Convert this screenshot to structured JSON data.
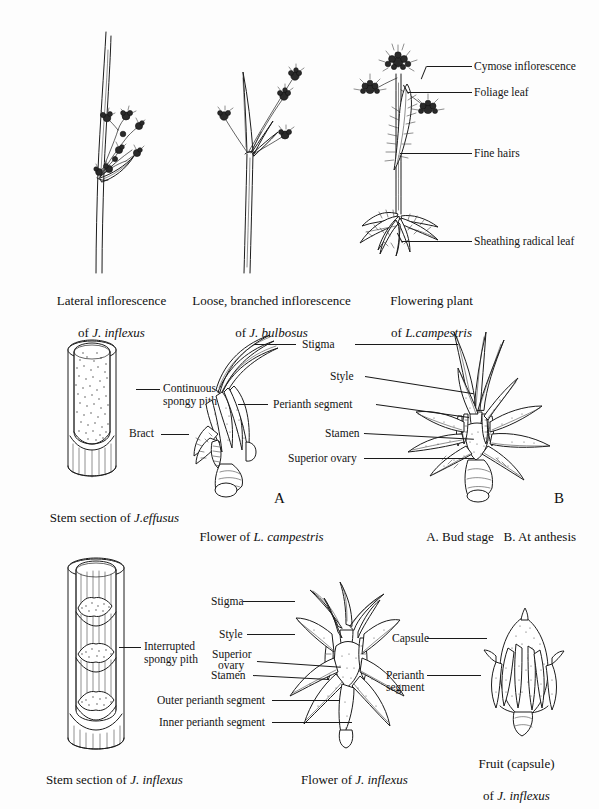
{
  "plate": {
    "title": "Juncaceae plant structure plate",
    "background_color": "#fdfdfd",
    "ink_color": "#1c1c1c"
  },
  "figures": [
    {
      "id": "lateral-inflorescence",
      "caption_line1": "Lateral inflorescence",
      "caption_line2_prefix": "of ",
      "caption_line2_italic": "J. inflexus",
      "labels": []
    },
    {
      "id": "loose-branched-inflorescence",
      "caption_line1": "Loose, branched inflorescence",
      "caption_line2_prefix": "of ",
      "caption_line2_italic": "J. bulbosus",
      "labels": []
    },
    {
      "id": "flowering-plant",
      "caption_line1": "Flowering plant",
      "caption_line2_prefix": "of ",
      "caption_line2_italic": "L.campestris",
      "labels": [
        "Cymose inflorescence",
        "Foliage leaf",
        "Fine hairs",
        "Sheathing radical leaf"
      ]
    },
    {
      "id": "stem-section-effusus",
      "caption_line1_prefix": "Stem section of ",
      "caption_line1_italic": "J.effusus",
      "labels": [
        "Continuous",
        "spongy pith"
      ]
    },
    {
      "id": "flower-l-campestris",
      "caption_line1_prefix": "Flower of ",
      "caption_line1_italic": "L. campestris",
      "labels": [
        "Bract"
      ]
    },
    {
      "id": "flower-stages",
      "caption_line1": "A. Bud stage   B. At anthesis",
      "labels": [
        "Stigma",
        "Style",
        "Perianth segment",
        "Stamen",
        "Superior ovary"
      ],
      "markers": [
        "A",
        "B"
      ]
    },
    {
      "id": "stem-section-inflexus",
      "caption_line1_prefix": "Stem section of ",
      "caption_line1_italic": "J. inflexus",
      "labels": [
        "Interrupted",
        "spongy pith"
      ]
    },
    {
      "id": "flower-j-inflexus",
      "caption_line1_prefix": "Flower of ",
      "caption_line1_italic": "J. inflexus",
      "labels": [
        "Stigma",
        "Style",
        "Superior",
        "ovary",
        "Stamen",
        "Outer perianth segment",
        "Inner perianth segment"
      ]
    },
    {
      "id": "fruit-capsule",
      "caption_line1": "Fruit (capsule)",
      "caption_line2_prefix": "of ",
      "caption_line2_italic": "J. inflexus",
      "labels": [
        "Capsule",
        "Perianth",
        "segment"
      ]
    }
  ],
  "text": {
    "cymose_inflorescence": "Cymose inflorescence",
    "foliage_leaf": "Foliage leaf",
    "fine_hairs": "Fine hairs",
    "sheathing_radical_leaf": "Sheathing radical leaf",
    "continuous": "Continuous",
    "spongy_pith": "spongy pith",
    "bract": "Bract",
    "stigma": "Stigma",
    "style": "Style",
    "perianth_segment": "Perianth segment",
    "stamen": "Stamen",
    "superior_ovary": "Superior ovary",
    "interrupted": "Interrupted",
    "spongy_pith_2": "spongy pith",
    "stigma_2": "Stigma",
    "style_2": "Style",
    "superior": "Superior",
    "ovary": "ovary",
    "stamen_2": "Stamen",
    "outer_perianth_segment": "Outer perianth segment",
    "inner_perianth_segment": "Inner perianth segment",
    "capsule": "Capsule",
    "perianth": "Perianth",
    "segment": "segment",
    "marker_a": "A",
    "marker_b": "B",
    "cap_lateral_1": "Lateral inflorescence",
    "cap_lateral_2_pre": "of ",
    "cap_lateral_2_it": "J. inflexus",
    "cap_loose_1": "Loose, branched inflorescence",
    "cap_loose_2_pre": "of ",
    "cap_loose_2_it": "J. bulbosus",
    "cap_flowering_1": "Flowering plant",
    "cap_flowering_2_pre": "of ",
    "cap_flowering_2_it": "L.campestris",
    "cap_stem_effusus_pre": "Stem section of ",
    "cap_stem_effusus_it": "J.effusus",
    "cap_flower_camp_pre": "Flower of ",
    "cap_flower_camp_it": "L. campestris",
    "cap_stages": "A. Bud stage   B. At anthesis",
    "cap_stem_inflexus_pre": "Stem section of ",
    "cap_stem_inflexus_it": "J. inflexus",
    "cap_flower_inflexus_pre": "Flower of ",
    "cap_flower_inflexus_it": "J. inflexus",
    "cap_fruit_1": "Fruit (capsule)",
    "cap_fruit_2_pre": "of ",
    "cap_fruit_2_it": "J. inflexus"
  }
}
